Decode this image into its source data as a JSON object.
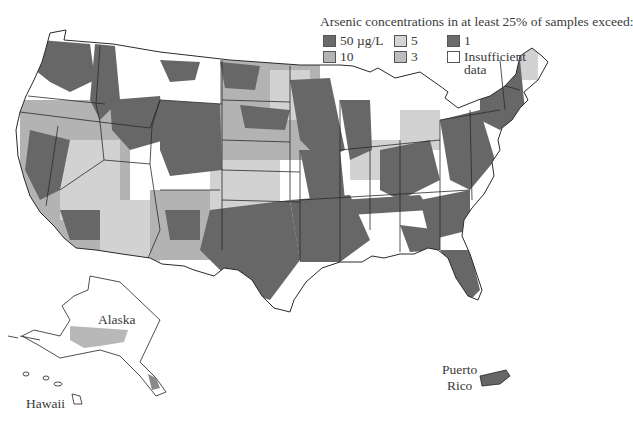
{
  "title": "Arsenic concentrations in at least 25% of samples exceed:",
  "legend": [
    {
      "label": "50 µg/L",
      "color": "#6a6a6a"
    },
    {
      "label": "10",
      "color": "#b4b4b4"
    },
    {
      "label": "5",
      "color": "#d4d4d4"
    },
    {
      "label": "3",
      "color": "#bdbdbd"
    },
    {
      "label": "1",
      "color": "#6c6c6c"
    },
    {
      "label": "Insufficient",
      "label2": "data",
      "color": "#ffffff"
    }
  ],
  "labels": {
    "alaska": "Alaska",
    "hawaii": "Hawaii",
    "puerto_rico_1": "Puerto",
    "puerto_rico_2": "Rico"
  },
  "colors": {
    "dark": "#676767",
    "mid": "#b3b3b3",
    "light": "#d2d2d2",
    "none": "#ffffff",
    "border": "#2a2a2a"
  }
}
